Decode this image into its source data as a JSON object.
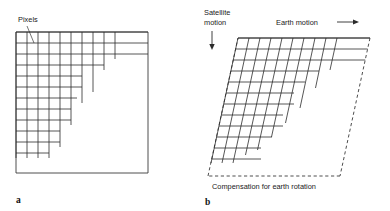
{
  "figure": {
    "background_color": "#ffffff",
    "line_color": "#2b2b2b"
  },
  "panel_a": {
    "letter": "a",
    "pixels_label": "Pixels",
    "frame": {
      "x": 16,
      "y": 32,
      "width": 132,
      "height": 141
    },
    "grid": {
      "cell_width": 11.0,
      "cell_height": 11.0,
      "columns": 12,
      "rows": 12,
      "row_extents": [
        12,
        12,
        10,
        8,
        7,
        7,
        6,
        6,
        5,
        5,
        4,
        3
      ],
      "col_extents": [
        12,
        12,
        11,
        10,
        8,
        8,
        7,
        6,
        5,
        4,
        2,
        2
      ]
    }
  },
  "panel_b": {
    "letter": "b",
    "satellite_motion_label_line1": "Satellite",
    "satellite_motion_label_line2": "motion",
    "earth_motion_label": "Earth motion",
    "compensation_label": "Compensation for earth rotation",
    "parallelogram": {
      "top_left_x": 238,
      "top_right_x": 370,
      "top_y": 38,
      "bottom_left_x": 208,
      "bottom_right_x": 340,
      "bottom_y": 176,
      "skew_px": -30
    },
    "grid": {
      "cell_width": 11.0,
      "cell_height": 11.0,
      "columns": 12,
      "rows": 12,
      "step_shift_per_block": 11.0,
      "row_extents": [
        12,
        12,
        11,
        9,
        8,
        7,
        7,
        6,
        6,
        5,
        4,
        4
      ]
    }
  },
  "icons": {
    "down_arrow": "satellite-motion-arrow",
    "right_arrow": "earth-motion-arrow"
  }
}
